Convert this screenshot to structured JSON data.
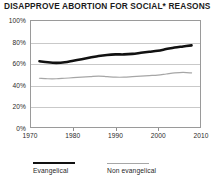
{
  "chart_data": {
    "type": "line",
    "title": "DISAPPROVE ABORTION FOR SOCIAL* REASONS",
    "xlabel": "",
    "ylabel": "",
    "xlim": [
      1970,
      2010
    ],
    "ylim": [
      0,
      100
    ],
    "grid": true,
    "legend_position": "bottom-left",
    "x_tick_labels": [
      "1970",
      "1980",
      "1990",
      "2000",
      "2010"
    ],
    "x_ticks": [
      1970,
      1980,
      1990,
      2000,
      2010
    ],
    "y_tick_labels": [
      "0%",
      "20%",
      "40%",
      "60%",
      "80%",
      "100%"
    ],
    "y_ticks": [
      0,
      20,
      40,
      60,
      80,
      100
    ],
    "series": [
      {
        "name": "Evangelical",
        "color": "#111111",
        "width": 2.6,
        "x": [
          1972,
          1974,
          1976,
          1978,
          1980,
          1982,
          1984,
          1986,
          1988,
          1990,
          1992,
          1994,
          1996,
          1998,
          2000,
          2002,
          2004,
          2006,
          2008
        ],
        "values": [
          62,
          61,
          60.5,
          61,
          62.5,
          64,
          65.5,
          67,
          68,
          68.5,
          68.5,
          69,
          70,
          71,
          72,
          73.5,
          75,
          76,
          77
        ]
      },
      {
        "name": "Non evangelical",
        "color": "#a6a6a6",
        "width": 1.2,
        "x": [
          1972,
          1974,
          1976,
          1978,
          1980,
          1982,
          1984,
          1986,
          1988,
          1990,
          1992,
          1994,
          1996,
          1998,
          2000,
          2002,
          2004,
          2006,
          2008
        ],
        "values": [
          46,
          45.5,
          45.5,
          46,
          46.5,
          47,
          47.5,
          48,
          47.5,
          47,
          47,
          47.5,
          48,
          48.5,
          49,
          50,
          51,
          51.5,
          51
        ]
      }
    ]
  },
  "legend": {
    "entries": [
      {
        "label": "Evangelical"
      },
      {
        "label": "Non evangelical"
      }
    ]
  }
}
